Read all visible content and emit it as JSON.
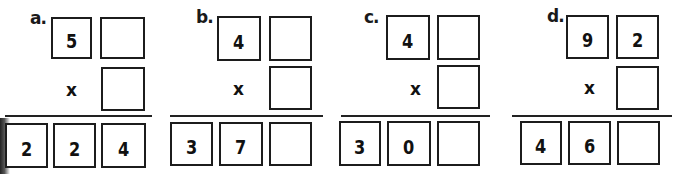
{
  "problems": [
    {
      "label": "a.",
      "top": [
        "5",
        ""
      ],
      "operator": "x",
      "multiplier": "",
      "result": [
        "2",
        "2",
        "4"
      ]
    },
    {
      "label": "b.",
      "top": [
        "4",
        ""
      ],
      "operator": "x",
      "multiplier": "",
      "result": [
        "3",
        "7",
        ""
      ]
    },
    {
      "label": "c.",
      "top": [
        "4",
        ""
      ],
      "operator": "x",
      "multiplier": "",
      "result": [
        "3",
        "0",
        ""
      ]
    },
    {
      "label": "d.",
      "top": [
        "9",
        "2"
      ],
      "operator": "x",
      "multiplier": "",
      "result": [
        "4",
        "6",
        ""
      ]
    }
  ]
}
